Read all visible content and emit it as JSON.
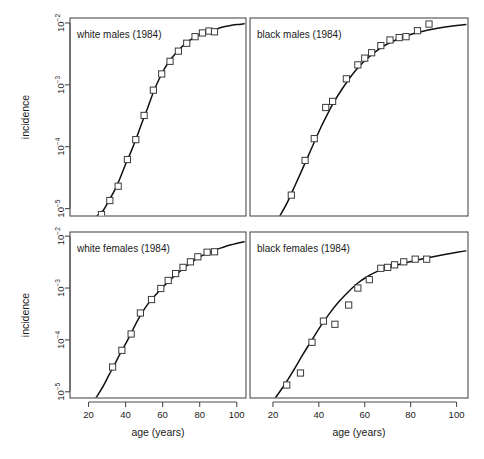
{
  "figure": {
    "xlabel": "age (years)",
    "ylabel": "incidence",
    "xticks": [
      20,
      40,
      60,
      80,
      100
    ],
    "yticks_exp": [
      -2,
      -3,
      -4,
      -5
    ],
    "ytick_base": "10",
    "xlim": [
      10,
      105
    ],
    "ylim_exp": [
      -5.12,
      -1.92
    ],
    "grid": false,
    "legend": "none",
    "marker_style": "open-square",
    "curve_color": "#111111",
    "marker_edge_color": "#3a3a3a",
    "marker_face_color": "#ffffff",
    "frame_color": "#4d4d4d",
    "background": "#ffffff"
  },
  "chart_data": {
    "type": "scatter",
    "title": "",
    "xlabel": "age (years)",
    "ylabel": "incidence",
    "xlim": [
      10,
      105
    ],
    "ylim": [
      7.5e-06,
      0.012
    ],
    "yscale": "log",
    "grid": false,
    "legend_position": "none",
    "panels": [
      {
        "id": "white-males",
        "label": "white males (1984)",
        "row": 0,
        "col": 0,
        "points": [
          {
            "age": 27,
            "incidence": 8e-06
          },
          {
            "age": 31.5,
            "incidence": 1.35e-05
          },
          {
            "age": 36,
            "incidence": 2.3e-05
          },
          {
            "age": 41,
            "incidence": 6.2e-05
          },
          {
            "age": 45.5,
            "incidence": 0.00013
          },
          {
            "age": 50,
            "incidence": 0.00032
          },
          {
            "age": 55,
            "incidence": 0.00082
          },
          {
            "age": 59.5,
            "incidence": 0.0015
          },
          {
            "age": 64,
            "incidence": 0.0024
          },
          {
            "age": 68.5,
            "incidence": 0.0035
          },
          {
            "age": 73,
            "incidence": 0.0047
          },
          {
            "age": 77.5,
            "incidence": 0.006
          },
          {
            "age": 81.5,
            "incidence": 0.0069
          },
          {
            "age": 85,
            "incidence": 0.0074
          },
          {
            "age": 88,
            "incidence": 0.0072
          }
        ],
        "curve": [
          {
            "age": 24.5,
            "incidence": 7.6e-06
          },
          {
            "age": 28,
            "incidence": 9.4e-06
          },
          {
            "age": 31,
            "incidence": 1.35e-05
          },
          {
            "age": 34,
            "incidence": 1.95e-05
          },
          {
            "age": 37,
            "incidence": 3.1e-05
          },
          {
            "age": 40,
            "incidence": 5.2e-05
          },
          {
            "age": 43,
            "incidence": 8.4e-05
          },
          {
            "age": 46,
            "incidence": 0.000142
          },
          {
            "age": 49,
            "incidence": 0.00025
          },
          {
            "age": 52,
            "incidence": 0.00043
          },
          {
            "age": 55,
            "incidence": 0.00076
          },
          {
            "age": 58,
            "incidence": 0.00122
          },
          {
            "age": 61,
            "incidence": 0.00182
          },
          {
            "age": 64,
            "incidence": 0.0025
          },
          {
            "age": 67,
            "incidence": 0.0032
          },
          {
            "age": 70,
            "incidence": 0.004
          },
          {
            "age": 73,
            "incidence": 0.0048
          },
          {
            "age": 76,
            "incidence": 0.0056
          },
          {
            "age": 79,
            "incidence": 0.0063
          },
          {
            "age": 82,
            "incidence": 0.0069
          },
          {
            "age": 85,
            "incidence": 0.0074
          },
          {
            "age": 88,
            "incidence": 0.0078
          },
          {
            "age": 92,
            "incidence": 0.0085
          },
          {
            "age": 96,
            "incidence": 0.009
          },
          {
            "age": 100,
            "incidence": 0.0094
          },
          {
            "age": 104,
            "incidence": 0.0097
          }
        ]
      },
      {
        "id": "black-males",
        "label": "black males (1984)",
        "row": 0,
        "col": 1,
        "points": [
          {
            "age": 28,
            "incidence": 1.65e-05
          },
          {
            "age": 34,
            "incidence": 6e-05
          },
          {
            "age": 38,
            "incidence": 0.000135
          },
          {
            "age": 43,
            "incidence": 0.00043
          },
          {
            "age": 46,
            "incidence": 0.00054
          },
          {
            "age": 52,
            "incidence": 0.00125
          },
          {
            "age": 57,
            "incidence": 0.0021
          },
          {
            "age": 60,
            "incidence": 0.0027
          },
          {
            "age": 63,
            "incidence": 0.0033
          },
          {
            "age": 67,
            "incidence": 0.0043
          },
          {
            "age": 71,
            "incidence": 0.0053
          },
          {
            "age": 75,
            "incidence": 0.0058
          },
          {
            "age": 78,
            "incidence": 0.006
          },
          {
            "age": 83,
            "incidence": 0.0075
          },
          {
            "age": 88,
            "incidence": 0.0096
          }
        ],
        "curve": [
          {
            "age": 23,
            "incidence": 7.6e-06
          },
          {
            "age": 26,
            "incidence": 1.2e-05
          },
          {
            "age": 29,
            "incidence": 2.1e-05
          },
          {
            "age": 32,
            "incidence": 3.7e-05
          },
          {
            "age": 35,
            "incidence": 6.6e-05
          },
          {
            "age": 38,
            "incidence": 0.000118
          },
          {
            "age": 41,
            "incidence": 0.00021
          },
          {
            "age": 44,
            "incidence": 0.00035
          },
          {
            "age": 47,
            "incidence": 0.00056
          },
          {
            "age": 50,
            "incidence": 0.00084
          },
          {
            "age": 53,
            "incidence": 0.00122
          },
          {
            "age": 56,
            "incidence": 0.0017
          },
          {
            "age": 59,
            "incidence": 0.00225
          },
          {
            "age": 62,
            "incidence": 0.00285
          },
          {
            "age": 65,
            "incidence": 0.0035
          },
          {
            "age": 68,
            "incidence": 0.0042
          },
          {
            "age": 71,
            "incidence": 0.0048
          },
          {
            "age": 74,
            "incidence": 0.0054
          },
          {
            "age": 77,
            "incidence": 0.006
          },
          {
            "age": 81,
            "incidence": 0.0067
          },
          {
            "age": 85,
            "incidence": 0.0073
          },
          {
            "age": 90,
            "incidence": 0.008
          },
          {
            "age": 95,
            "incidence": 0.0086
          },
          {
            "age": 100,
            "incidence": 0.0091
          },
          {
            "age": 104,
            "incidence": 0.0094
          }
        ]
      },
      {
        "id": "white-females",
        "label": "white females (1984)",
        "row": 1,
        "col": 0,
        "points": [
          {
            "age": 33,
            "incidence": 3e-05
          },
          {
            "age": 38,
            "incidence": 6.3e-05
          },
          {
            "age": 43,
            "incidence": 0.00013
          },
          {
            "age": 48,
            "incidence": 0.00033
          },
          {
            "age": 54,
            "incidence": 0.0006
          },
          {
            "age": 59,
            "incidence": 0.00098
          },
          {
            "age": 63,
            "incidence": 0.0014
          },
          {
            "age": 67,
            "incidence": 0.0019
          },
          {
            "age": 71,
            "incidence": 0.0025
          },
          {
            "age": 75,
            "incidence": 0.0032
          },
          {
            "age": 79,
            "incidence": 0.004
          },
          {
            "age": 84,
            "incidence": 0.0049
          },
          {
            "age": 88,
            "incidence": 0.005
          }
        ],
        "curve": [
          {
            "age": 24,
            "incidence": 7.6e-06
          },
          {
            "age": 28,
            "incidence": 1.3e-05
          },
          {
            "age": 31,
            "incidence": 2.1e-05
          },
          {
            "age": 34,
            "incidence": 3.3e-05
          },
          {
            "age": 37,
            "incidence": 5.4e-05
          },
          {
            "age": 40,
            "incidence": 8.4e-05
          },
          {
            "age": 43,
            "incidence": 0.000135
          },
          {
            "age": 46,
            "incidence": 0.00022
          },
          {
            "age": 49,
            "incidence": 0.00034
          },
          {
            "age": 52,
            "incidence": 0.00049
          },
          {
            "age": 55,
            "incidence": 0.00066
          },
          {
            "age": 58,
            "incidence": 0.00087
          },
          {
            "age": 61,
            "incidence": 0.00112
          },
          {
            "age": 64,
            "incidence": 0.00142
          },
          {
            "age": 67,
            "incidence": 0.00178
          },
          {
            "age": 70,
            "incidence": 0.0022
          },
          {
            "age": 73,
            "incidence": 0.0027
          },
          {
            "age": 76,
            "incidence": 0.0032
          },
          {
            "age": 79,
            "incidence": 0.0038
          },
          {
            "age": 83,
            "incidence": 0.0045
          },
          {
            "age": 87,
            "incidence": 0.0052
          },
          {
            "age": 92,
            "incidence": 0.006
          },
          {
            "age": 97,
            "incidence": 0.0068
          },
          {
            "age": 104,
            "incidence": 0.0078
          }
        ]
      },
      {
        "id": "black-females",
        "label": "black females (1984)",
        "row": 1,
        "col": 1,
        "points": [
          {
            "age": 26,
            "incidence": 1.35e-05
          },
          {
            "age": 32,
            "incidence": 2.3e-05
          },
          {
            "age": 37,
            "incidence": 9e-05
          },
          {
            "age": 42,
            "incidence": 0.00023
          },
          {
            "age": 47,
            "incidence": 0.0002
          },
          {
            "age": 53,
            "incidence": 0.00047
          },
          {
            "age": 57,
            "incidence": 0.001
          },
          {
            "age": 62,
            "incidence": 0.00145
          },
          {
            "age": 67,
            "incidence": 0.0024
          },
          {
            "age": 70,
            "incidence": 0.0025
          },
          {
            "age": 73,
            "incidence": 0.0028
          },
          {
            "age": 77,
            "incidence": 0.0032
          },
          {
            "age": 82,
            "incidence": 0.0036
          },
          {
            "age": 87,
            "incidence": 0.0036
          }
        ],
        "curve": [
          {
            "age": 21,
            "incidence": 7.6e-06
          },
          {
            "age": 25,
            "incidence": 1.35e-05
          },
          {
            "age": 29,
            "incidence": 2.6e-05
          },
          {
            "age": 33,
            "incidence": 5.2e-05
          },
          {
            "age": 37,
            "incidence": 0.0001
          },
          {
            "age": 41,
            "incidence": 0.00019
          },
          {
            "age": 45,
            "incidence": 0.00034
          },
          {
            "age": 49,
            "incidence": 0.00056
          },
          {
            "age": 53,
            "incidence": 0.00086
          },
          {
            "age": 57,
            "incidence": 0.00125
          },
          {
            "age": 61,
            "incidence": 0.00165
          },
          {
            "age": 65,
            "incidence": 0.00205
          },
          {
            "age": 69,
            "incidence": 0.0024
          },
          {
            "age": 73,
            "incidence": 0.0027
          },
          {
            "age": 77,
            "incidence": 0.003
          },
          {
            "age": 82,
            "incidence": 0.0034
          },
          {
            "age": 87,
            "incidence": 0.0038
          },
          {
            "age": 92,
            "incidence": 0.0042
          },
          {
            "age": 98,
            "incidence": 0.0047
          },
          {
            "age": 104,
            "incidence": 0.0052
          }
        ]
      }
    ]
  }
}
